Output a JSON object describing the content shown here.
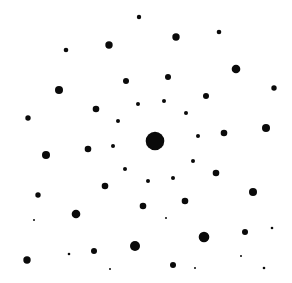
{
  "image": {
    "width": 292,
    "height": 283,
    "background": "#ffffff",
    "spot_color": "#0a0a0a",
    "description": "Diffraction spot pattern with a large central spot"
  },
  "spots": [
    {
      "x": 139,
      "y": 17,
      "r": 2.2
    },
    {
      "x": 176,
      "y": 37,
      "r": 3.7
    },
    {
      "x": 219,
      "y": 32,
      "r": 2.3
    },
    {
      "x": 109,
      "y": 45,
      "r": 3.7
    },
    {
      "x": 66,
      "y": 50,
      "r": 2.3
    },
    {
      "x": 236,
      "y": 69,
      "r": 4.3
    },
    {
      "x": 168,
      "y": 77,
      "r": 3
    },
    {
      "x": 126,
      "y": 81,
      "r": 3
    },
    {
      "x": 59,
      "y": 90,
      "r": 4
    },
    {
      "x": 274,
      "y": 88,
      "r": 2.7
    },
    {
      "x": 206,
      "y": 96,
      "r": 3
    },
    {
      "x": 164,
      "y": 101,
      "r": 2
    },
    {
      "x": 96,
      "y": 109,
      "r": 3.3
    },
    {
      "x": 138,
      "y": 104,
      "r": 2
    },
    {
      "x": 186,
      "y": 113,
      "r": 2
    },
    {
      "x": 28,
      "y": 118,
      "r": 2.7
    },
    {
      "x": 118,
      "y": 121,
      "r": 2
    },
    {
      "x": 266,
      "y": 128,
      "r": 4
    },
    {
      "x": 224,
      "y": 133,
      "r": 3.3
    },
    {
      "x": 198,
      "y": 136,
      "r": 2
    },
    {
      "x": 155,
      "y": 141,
      "r": 9.3
    },
    {
      "x": 113,
      "y": 146,
      "r": 2
    },
    {
      "x": 88,
      "y": 149,
      "r": 3.3
    },
    {
      "x": 46,
      "y": 155,
      "r": 4
    },
    {
      "x": 193,
      "y": 161,
      "r": 2
    },
    {
      "x": 125,
      "y": 169,
      "r": 2
    },
    {
      "x": 216,
      "y": 173,
      "r": 3.3
    },
    {
      "x": 173,
      "y": 178,
      "r": 2
    },
    {
      "x": 148,
      "y": 181,
      "r": 2
    },
    {
      "x": 105,
      "y": 186,
      "r": 3.3
    },
    {
      "x": 253,
      "y": 192,
      "r": 4
    },
    {
      "x": 38,
      "y": 195,
      "r": 2.7
    },
    {
      "x": 185,
      "y": 201,
      "r": 3.3
    },
    {
      "x": 143,
      "y": 206,
      "r": 3.3
    },
    {
      "x": 76,
      "y": 214,
      "r": 4.3
    },
    {
      "x": 34,
      "y": 220,
      "r": 1
    },
    {
      "x": 166,
      "y": 218,
      "r": 1
    },
    {
      "x": 272,
      "y": 228,
      "r": 1.3
    },
    {
      "x": 245,
      "y": 232,
      "r": 3
    },
    {
      "x": 204,
      "y": 237,
      "r": 5.3
    },
    {
      "x": 135,
      "y": 246,
      "r": 5
    },
    {
      "x": 94,
      "y": 251,
      "r": 3
    },
    {
      "x": 69,
      "y": 254,
      "r": 1.3
    },
    {
      "x": 27,
      "y": 260,
      "r": 3.7
    },
    {
      "x": 241,
      "y": 256,
      "r": 1
    },
    {
      "x": 173,
      "y": 265,
      "r": 3
    },
    {
      "x": 110,
      "y": 269,
      "r": 1
    },
    {
      "x": 195,
      "y": 268,
      "r": 1
    },
    {
      "x": 264,
      "y": 268,
      "r": 1.3
    }
  ]
}
